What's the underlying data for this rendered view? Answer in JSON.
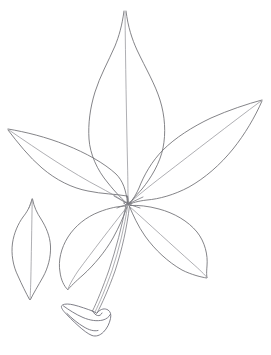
{
  "figure": {
    "style": "pen-and-ink outline drawing",
    "background_color": "#ffffff",
    "line_color": "#6e6e72",
    "vein_color": "#8c8c92",
    "canvas": {
      "width": 271,
      "height": 355
    }
  },
  "specimen": {
    "leaf_type": "palmately compound",
    "leaflet_count_attached": 5,
    "leaflet_count_detached": 1,
    "junction_point": {
      "x": 128,
      "y": 204
    },
    "parts": [
      {
        "name": "terminal-leaflet",
        "position": "top-center",
        "shape": "ovate-acuminate",
        "apex": {
          "x": 125,
          "y": 10
        },
        "base": {
          "x": 128,
          "y": 204
        },
        "widest_y": 103,
        "width_px": 73
      },
      {
        "name": "left-lateral-leaflet",
        "position": "upper-left",
        "shape": "lanceolate",
        "apex": {
          "x": 8,
          "y": 129
        },
        "base": {
          "x": 128,
          "y": 204
        },
        "width_px": 40
      },
      {
        "name": "right-lateral-leaflet",
        "position": "upper-right",
        "shape": "lanceolate",
        "apex": {
          "x": 262,
          "y": 100
        },
        "base": {
          "x": 128,
          "y": 204
        },
        "width_px": 44
      },
      {
        "name": "lower-left-leaflet",
        "position": "lower-left",
        "shape": "elliptic-acuminate",
        "apex": {
          "x": 68,
          "y": 290
        },
        "base": {
          "x": 128,
          "y": 204
        },
        "width_px": 42
      },
      {
        "name": "lower-right-leaflet",
        "position": "lower-right",
        "shape": "elliptic-acuminate",
        "apex": {
          "x": 207,
          "y": 278
        },
        "base": {
          "x": 128,
          "y": 204
        },
        "width_px": 46
      },
      {
        "name": "detached-leaflet",
        "position": "left-margin",
        "shape": "elliptic",
        "apex": {
          "x": 32,
          "y": 199
        },
        "base": {
          "x": 30,
          "y": 300
        },
        "widest_y": 247,
        "width_px": 38
      },
      {
        "name": "petiole",
        "position": "lower-center",
        "shape": "slender-stalk",
        "top": {
          "x": 128,
          "y": 206
        },
        "bottom": {
          "x": 92,
          "y": 312
        }
      },
      {
        "name": "pulvinus-base",
        "position": "bottom-left",
        "shape": "flared-angular-sheath",
        "bounds": {
          "x": 61,
          "y": 303,
          "width": 50,
          "height": 33
        }
      }
    ]
  },
  "annotations": {
    "labels": [],
    "scale_bar": null,
    "caption": ""
  }
}
